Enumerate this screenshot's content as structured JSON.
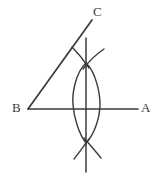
{
  "figure": {
    "background_color": "#ffffff",
    "stroke_color": "#3a3a3a",
    "label_color": "#3a3a3a",
    "width": 162,
    "height": 179
  },
  "labels": {
    "a": "A",
    "b": "B",
    "c": "C"
  },
  "geometry": {
    "vertex_b": {
      "x": 28,
      "y": 109
    },
    "ray_ba": {
      "x1": 28,
      "y1": 109,
      "x2": 138,
      "y2": 109
    },
    "ray_bc": {
      "x1": 28,
      "y1": 109,
      "x2": 92,
      "y2": 20
    },
    "bisector_line": {
      "x1": 86,
      "y1": 38,
      "x2": 86,
      "y2": 172
    },
    "arc_left": {
      "start_x": 86,
      "start_y": 63,
      "end_x": 86,
      "end_y": 143,
      "bulge_x": 73
    },
    "arc_right": {
      "start_x": 86,
      "start_y": 63,
      "end_x": 86,
      "end_y": 143,
      "bulge_x": 100
    },
    "top_intersection": {
      "x": 86,
      "y": 63
    },
    "bottom_intersection": {
      "x": 86,
      "y": 143
    },
    "top_tick_left": {
      "x1": 72,
      "y1": 47,
      "x2": 86,
      "y2": 63
    },
    "top_tick_right": {
      "x1": 103,
      "y1": 49,
      "x2": 86,
      "y2": 63
    },
    "bottom_tick_left": {
      "x1": 74,
      "y1": 159,
      "x2": 86,
      "y2": 143
    },
    "bottom_tick_right": {
      "x1": 101,
      "y1": 158,
      "x2": 86,
      "y2": 143
    }
  }
}
